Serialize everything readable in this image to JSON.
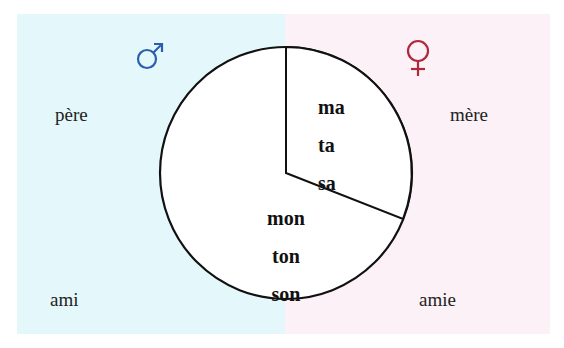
{
  "diagram": {
    "masculine_symbol": "♂",
    "feminine_symbol": "♀",
    "colors": {
      "masculine_bg": "#e4f8fb",
      "feminine_bg": "#fbf1f6",
      "masculine_symbol": "#2a5fb0",
      "feminine_symbol": "#b0283c",
      "stroke": "#111111"
    },
    "nouns": {
      "top_left": "père",
      "top_right": "mère",
      "bottom_left": "ami",
      "bottom_right": "amie"
    },
    "pie": {
      "feminine_wedge": [
        "ma",
        "ta",
        "sa"
      ],
      "masculine_region": [
        "mon",
        "ton",
        "son"
      ]
    }
  }
}
